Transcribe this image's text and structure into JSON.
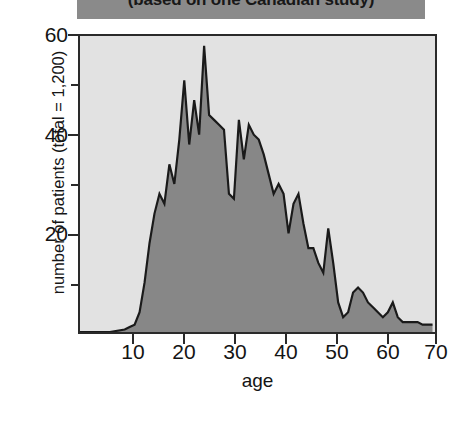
{
  "title": {
    "text": "(based on one Canadian study)",
    "banner_color": "#8a8a8a"
  },
  "axes": {
    "x_title": "age",
    "y_title": "number of patients (total = 1,200)",
    "x_ticks": [
      "10",
      "20",
      "30",
      "40",
      "50",
      "60",
      "70"
    ],
    "y_ticks": [
      "20",
      "40",
      "60"
    ],
    "y_minor_ticks": [
      "10",
      "30",
      "50"
    ]
  },
  "colors": {
    "plot_background": "#e2e2e2",
    "area_fill": "#878787",
    "line": "#1a1a1a",
    "axis": "#2a2a2a"
  },
  "chart_data": {
    "type": "area",
    "title": "(based on one Canadian study)",
    "xlabel": "age",
    "ylabel": "number of patients (total = 1,200)",
    "xlim": [
      -1,
      70.5
    ],
    "ylim": [
      0,
      60
    ],
    "grid": false,
    "legend": "none",
    "x_tick_values": [
      10,
      20,
      30,
      40,
      50,
      60,
      70
    ],
    "y_tick_values": [
      0,
      10,
      20,
      30,
      40,
      50,
      60
    ],
    "y_labeled_ticks": [
      20,
      40,
      60
    ],
    "series_name": "patients by age",
    "x": [
      -1,
      5,
      8,
      9,
      10,
      11,
      12,
      13,
      14,
      15,
      16,
      17,
      18,
      19,
      20,
      21,
      22,
      23,
      24,
      25,
      26,
      27,
      28,
      29,
      30,
      31,
      32,
      33,
      34,
      35,
      36,
      37,
      38,
      39,
      40,
      41,
      42,
      43,
      44,
      45,
      46,
      47,
      48,
      49,
      50,
      51,
      52,
      53,
      54,
      55,
      56,
      57,
      58,
      59,
      60,
      61,
      62,
      63,
      64,
      65,
      66,
      67,
      68,
      69,
      70
    ],
    "values": [
      0,
      0,
      0.5,
      1,
      1.5,
      4,
      10,
      18,
      24,
      28,
      26,
      34,
      30,
      39,
      51,
      38,
      47,
      40,
      58,
      44,
      43,
      42,
      41,
      28,
      27,
      43,
      35,
      42,
      40,
      39,
      36,
      32,
      28,
      30,
      28,
      20,
      26,
      28,
      22,
      17,
      17,
      14,
      12,
      21,
      14,
      6,
      3,
      4,
      8,
      9,
      8,
      6,
      5,
      4,
      3,
      4,
      6,
      3,
      2,
      2,
      2,
      2,
      1.5,
      1.5,
      1.5
    ]
  }
}
